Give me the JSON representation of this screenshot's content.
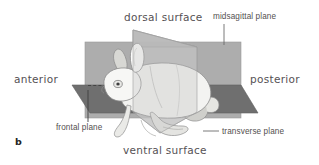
{
  "figure": {
    "panel_label": "b",
    "labels": {
      "dorsal": "dorsal surface",
      "ventral": "ventral surface",
      "anterior": "anterior",
      "posterior": "posterior",
      "midsagittal": "midsagittal plane",
      "frontal": "frontal plane",
      "transverse": "transverse plane"
    },
    "colors": {
      "midsagittal_plane": "#a8a8a8",
      "frontal_plane": "#6f6f6f",
      "transverse_plane": "#bdbdbd",
      "animal_body": "#f2f2f0",
      "animal_outline": "#8c8c8c",
      "label_text": "#53504f",
      "leader_line": "#6b6b6b",
      "background": "#ffffff"
    }
  }
}
